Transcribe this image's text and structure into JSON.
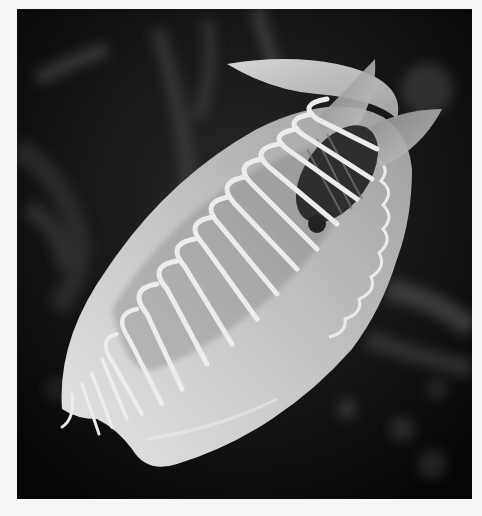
{
  "image": {
    "subject": "Venus flytrap with captured fly",
    "style": "grayscale photograph",
    "colors": {
      "matte": "#f6f6f6",
      "background": "#0c0c0c",
      "trap_light": "#d9d9d9",
      "trap_mid": "#a8a8a8",
      "teeth": "#e6e6e6",
      "fly_dark": "#2a2a2a"
    }
  }
}
